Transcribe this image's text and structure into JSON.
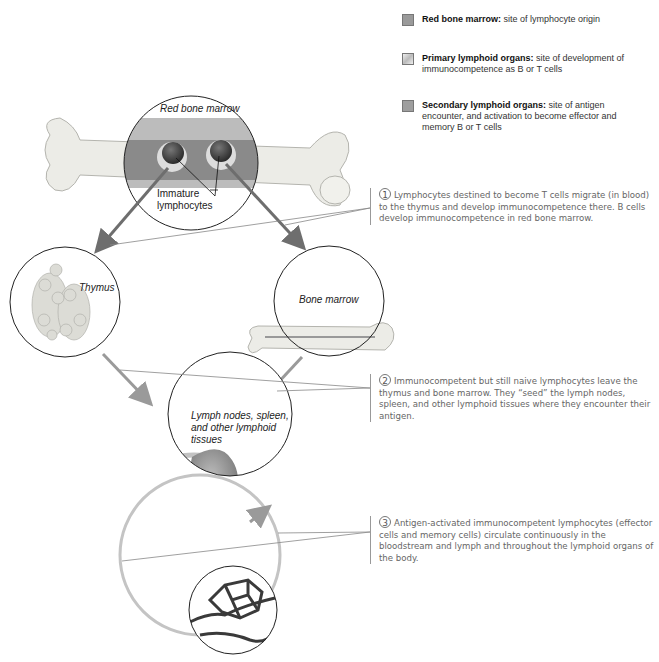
{
  "legend": {
    "items": [
      {
        "name": "red-bone-marrow",
        "title": "Red bone marrow:",
        "desc": " site of lymphocyte origin",
        "color": "#9a9a9a"
      },
      {
        "name": "primary-lymphoid-organs",
        "title": "Primary lymphoid organs:",
        "desc": " site of development of immunocompetence as B or T cells",
        "color": "#d6d6d6"
      },
      {
        "name": "secondary-lymphoid-organs",
        "title": "Secondary lymphoid organs:",
        "desc": " site of antigen encounter, and activation to become effector and memory B or T cells",
        "color": "#9e9e9e"
      }
    ]
  },
  "labels": {
    "red_bone_marrow": "Red bone marrow",
    "immature": "Immature",
    "lymphocytes": "lymphocytes",
    "thymus": "Thymus",
    "bone_marrow": "Bone marrow",
    "lymph_1": "Lymph nodes, spleen,",
    "lymph_2": "and other lymphoid",
    "lymph_3": "tissues"
  },
  "steps": [
    {
      "number": "1",
      "text": "Lymphocytes destined to become T cells migrate (in blood) to the thymus and develop immunocompetence there. B cells develop immunocompetence in red bone marrow."
    },
    {
      "number": "2",
      "text": "Immunocompetent but still naive lymphocytes leave the thymus and bone marrow. They “seed” the lymph nodes, spleen, and other lymphoid tissues where they encounter their antigen."
    },
    {
      "number": "3",
      "text": "Antigen-activated immunocompetent lymphocytes (effector cells and memory cells) circulate continuously in the bloodstream and lymph and throughout the lymphoid organs of the body."
    }
  ],
  "colors": {
    "arrow": "#6e6e6e",
    "circuit": "#bdbdbd",
    "bone": "#ebebe6",
    "marrow": "#8c8c8c"
  }
}
